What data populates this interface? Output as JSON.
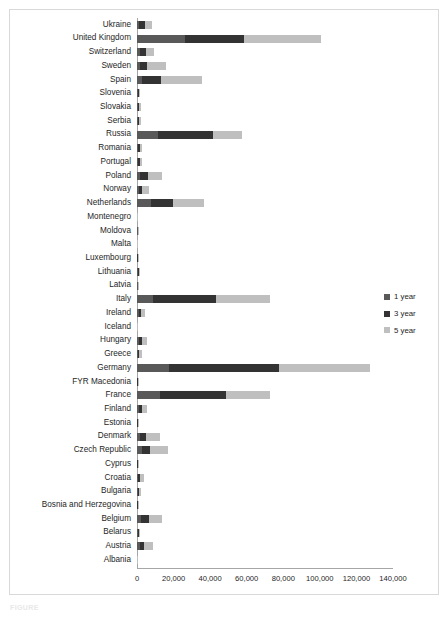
{
  "figure": {
    "caption": "FIGURE",
    "frame_color": "#d9d9d9"
  },
  "legend": {
    "position": "right",
    "items": [
      {
        "label": "1 year",
        "color": "#595959"
      },
      {
        "label": "3 year",
        "color": "#333333"
      },
      {
        "label": "5 year",
        "color": "#bfbfbf"
      }
    ]
  },
  "axis": {
    "tick_labels": [
      "0",
      "20,000",
      "40,000",
      "60,000",
      "80,000",
      "100,000",
      "120,000",
      "140,000"
    ],
    "tick_values": [
      0,
      20000,
      40000,
      60000,
      80000,
      100000,
      120000,
      140000
    ]
  },
  "chart_data": {
    "type": "bar",
    "orientation": "horizontal",
    "stacked": true,
    "title": "",
    "xlabel": "",
    "ylabel": "",
    "xlim": [
      0,
      140000
    ],
    "grid": false,
    "legend_position": "right",
    "categories": [
      "Ukraine",
      "United Kingdom",
      "Switzerland",
      "Sweden",
      "Spain",
      "Slovenia",
      "Slovakia",
      "Serbia",
      "Russia",
      "Romania",
      "Portugal",
      "Poland",
      "Norway",
      "Netherlands",
      "Montenegro",
      "Moldova",
      "Malta",
      "Luxembourg",
      "Lithuania",
      "Latvia",
      "Italy",
      "Ireland",
      "Iceland",
      "Hungary",
      "Greece",
      "Germany",
      "FYR Macedonia",
      "France",
      "Finland",
      "Estonia",
      "Denmark",
      "Czech Republic",
      "Cyprus",
      "Croatia",
      "Bulgaria",
      "Bosnia and Herzegovina",
      "Belgium",
      "Belarus",
      "Austria",
      "Albania"
    ],
    "series": [
      {
        "name": "1 year",
        "color": "#595959",
        "values": [
          1200,
          26500,
          1600,
          1800,
          2500,
          500,
          400,
          500,
          11500,
          500,
          600,
          1800,
          1000,
          7500,
          100,
          300,
          100,
          250,
          400,
          350,
          9000,
          900,
          100,
          900,
          600,
          17500,
          250,
          12500,
          900,
          250,
          1800,
          2900,
          150,
          700,
          450,
          250,
          2200,
          400,
          1500,
          100
        ]
      },
      {
        "name": "3 year",
        "color": "#333333",
        "values": [
          3200,
          32000,
          3500,
          3800,
          10500,
          600,
          700,
          700,
          30000,
          900,
          900,
          4200,
          2000,
          12000,
          100,
          200,
          100,
          200,
          600,
          350,
          34000,
          1400,
          100,
          1800,
          700,
          60000,
          250,
          36000,
          1600,
          200,
          3200,
          4200,
          150,
          1100,
          700,
          200,
          4200,
          700,
          2500,
          100
        ]
      },
      {
        "name": "5 year",
        "color": "#bfbfbf",
        "values": [
          4000,
          42000,
          4200,
          10500,
          22500,
          700,
          900,
          1100,
          16000,
          1500,
          1200,
          7500,
          3500,
          17000,
          100,
          200,
          100,
          200,
          500,
          400,
          30000,
          2200,
          100,
          2600,
          1200,
          50000,
          250,
          24000,
          3000,
          200,
          7500,
          10000,
          150,
          1900,
          900,
          200,
          7500,
          800,
          4500,
          100
        ]
      }
    ]
  }
}
